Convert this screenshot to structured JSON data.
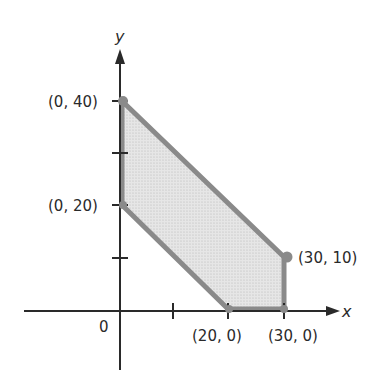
{
  "diagram": {
    "type": "feasible-region",
    "axes": {
      "x_label": "x",
      "y_label": "y",
      "origin_label": "0"
    },
    "ticks": {
      "x": [
        10,
        20,
        30
      ],
      "y": [
        10,
        20,
        30,
        40
      ]
    },
    "vertices": [
      {
        "label": "(0, 40)",
        "x": 0,
        "y": 40
      },
      {
        "label": "(0, 20)",
        "x": 0,
        "y": 20
      },
      {
        "label": "(20, 0)",
        "x": 20,
        "y": 0
      },
      {
        "label": "(30, 0)",
        "x": 30,
        "y": 0
      },
      {
        "label": "(30, 10)",
        "x": 30,
        "y": 10
      }
    ],
    "colors": {
      "region_fill": "#dcdcdc",
      "region_edge": "#8a8a8a",
      "axis": "#2a2a2a"
    }
  }
}
